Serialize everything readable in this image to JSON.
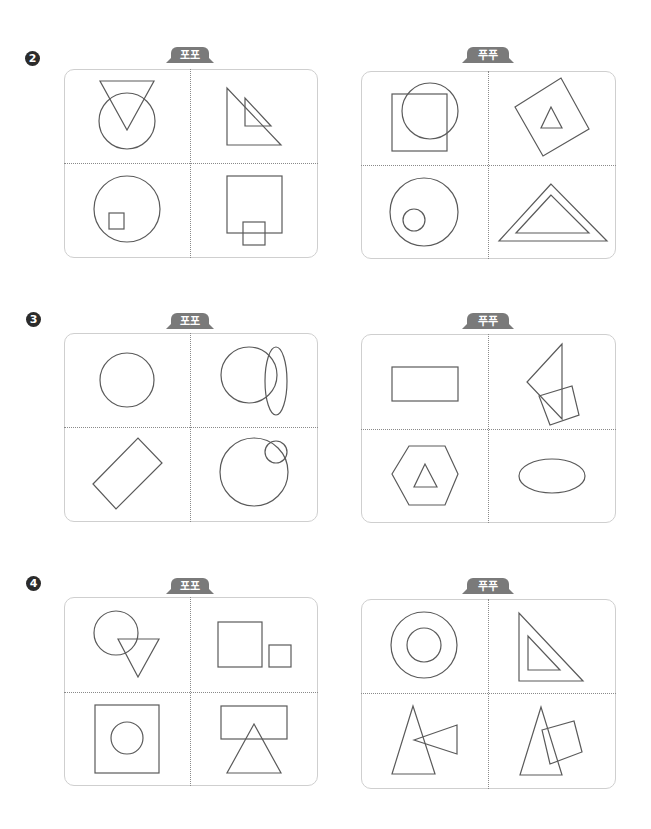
{
  "problems": [
    {
      "number": "2",
      "left": {
        "label": "포포",
        "cells": [
          "inverted triangle overlapping circle",
          "small right triangle inside larger right triangle",
          "small square inside circle",
          "small square overlapping bottom of large square"
        ]
      },
      "right": {
        "label": "푸푸",
        "cells": [
          "circle overlapping square",
          "small triangle inside rotated square",
          "small circle inside large circle",
          "triangle inside triangle"
        ]
      }
    },
    {
      "number": "3",
      "left": {
        "label": "포포",
        "cells": [
          "circle",
          "circle overlapping vertical ellipse",
          "rotated rectangle",
          "small circle overlapping large circle"
        ]
      },
      "right": {
        "label": "푸푸",
        "cells": [
          "rectangle",
          "triangle attached to rotated square",
          "triangle inside hexagon",
          "horizontal ellipse"
        ]
      }
    },
    {
      "number": "4",
      "left": {
        "label": "포포",
        "cells": [
          "circle overlapping inverted triangle",
          "large square beside small square",
          "circle inside square",
          "triangle overlapping rectangle"
        ]
      },
      "right": {
        "label": "푸푸",
        "cells": [
          "concentric circles",
          "right triangle inside right triangle",
          "tall triangle with sideways triangle",
          "tall triangle with rotated square"
        ]
      }
    }
  ],
  "colors": {
    "tab": "#7a7a7a",
    "panel_border": "#cfcfcf",
    "stroke": "#5a5a5a",
    "number_badge": "#2b2b2b"
  }
}
